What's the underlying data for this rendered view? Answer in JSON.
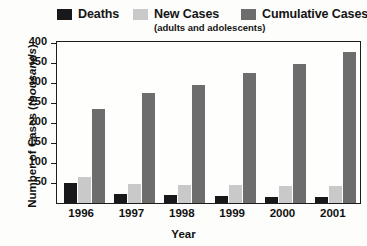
{
  "legend": {
    "items": [
      {
        "label": "Deaths",
        "sub": "",
        "color": "#18181a",
        "icon": "legend-swatch-icon"
      },
      {
        "label": "New Cases",
        "sub": "(adults and adolescents)",
        "color": "#c9c9c9",
        "icon": "legend-swatch-icon"
      },
      {
        "label": "Cumulative Cases",
        "sub": "",
        "color": "#6d6d6d",
        "icon": "legend-swatch-icon"
      }
    ]
  },
  "axes": {
    "ylabel_main": "Number of Cases (",
    "ylabel_em": "thousands",
    "ylabel_close": ")",
    "xlabel": "Year",
    "yticks": [
      "400",
      "350",
      "300",
      "250",
      "200",
      "150",
      "100",
      "50"
    ]
  },
  "chart_data": {
    "type": "bar",
    "title": "",
    "subtitle": "",
    "xlabel": "Year",
    "ylabel": "Number of Cases (thousands)",
    "ylim": [
      0,
      400
    ],
    "yticks": [
      50,
      100,
      150,
      200,
      250,
      300,
      350,
      400
    ],
    "grid": false,
    "legend_position": "top",
    "categories": [
      "1996",
      "1997",
      "1998",
      "1999",
      "2000",
      "2001"
    ],
    "series": [
      {
        "name": "Deaths",
        "color": "#18181a",
        "values": [
          50,
          22,
          20,
          18,
          16,
          15
        ]
      },
      {
        "name": "New Cases",
        "note": "(adults and adolescents)",
        "color": "#c9c9c9",
        "values": [
          65,
          47,
          45,
          44,
          42,
          42
        ]
      },
      {
        "name": "Cumulative Cases",
        "color": "#6d6d6d",
        "values": [
          235,
          275,
          295,
          325,
          348,
          378
        ]
      }
    ]
  }
}
